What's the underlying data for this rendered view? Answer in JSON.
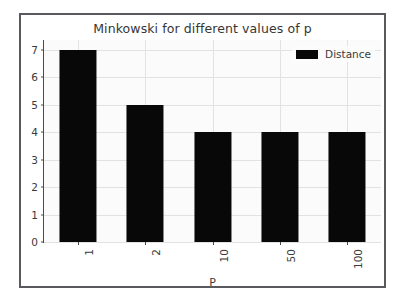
{
  "chart_data": {
    "type": "bar",
    "title": "Minkowski for different values of p",
    "xlabel": "P",
    "ylabel": "",
    "categories": [
      "1",
      "2",
      "10",
      "50",
      "100"
    ],
    "values": [
      7,
      5,
      4,
      4,
      4
    ],
    "series": [
      {
        "name": "Distance",
        "values": [
          7,
          5,
          4,
          4,
          4
        ]
      }
    ],
    "ylim": [
      0,
      7.35
    ],
    "yticks": [
      0,
      1,
      2,
      3,
      4,
      5,
      6,
      7
    ],
    "ytick_labels": [
      "0",
      "1",
      "2",
      "3",
      "4",
      "5",
      "6",
      "7"
    ],
    "xtick_labels": [
      "1",
      "2",
      "10",
      "50",
      "100"
    ],
    "xtick_rotation": 90,
    "grid": true,
    "legend": {
      "position": "upper right",
      "entries": [
        {
          "label": "Distance",
          "color": "#080808",
          "marker": "bar-swatch"
        }
      ]
    },
    "colors": {
      "bar": "#080808",
      "plot_background": "#fbfbfb",
      "grid": "#e2e2e2",
      "axis": "#4a4a4a",
      "text": "#3a3a3a",
      "frame": "#5a5a5e",
      "page_background": "#ffffff"
    }
  }
}
